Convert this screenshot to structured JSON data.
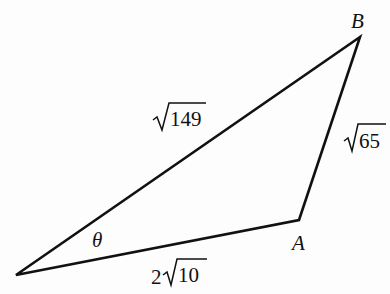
{
  "diagram": {
    "type": "triangle",
    "vertices": {
      "left": {
        "x": 16,
        "y": 275,
        "label": ""
      },
      "A": {
        "x": 299,
        "y": 220,
        "label": "A"
      },
      "B": {
        "x": 360,
        "y": 37,
        "label": "B"
      }
    },
    "sides": {
      "left_B": {
        "radicand": "149",
        "coef": "",
        "display": "√149"
      },
      "A_B": {
        "radicand": "65",
        "coef": "",
        "display": "√65"
      },
      "left_A": {
        "radicand": "10",
        "coef": "2",
        "display": "2√10"
      }
    },
    "angle": {
      "label": "θ",
      "at": "left"
    },
    "stroke_color": "#111111"
  }
}
